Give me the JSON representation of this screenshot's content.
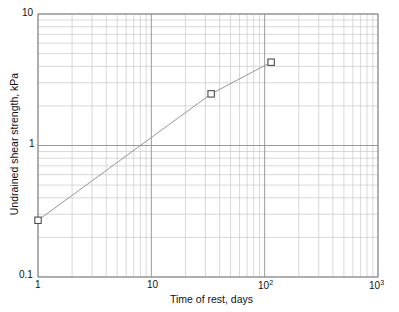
{
  "chart_data": {
    "type": "line",
    "title": "",
    "subtitle": "",
    "xlabel": "Time of rest, days",
    "ylabel": "Undrained shear strength, kPa",
    "xscale": "log",
    "yscale": "log",
    "xlim": [
      1,
      1000
    ],
    "ylim": [
      0.1,
      10
    ],
    "grid": "major-and-minor-log",
    "legend": "none",
    "marker": "open-square",
    "series": [
      {
        "name": "Undrained shear strength",
        "x": [
          1,
          33.7,
          114
        ],
        "y": [
          0.27,
          2.47,
          4.3
        ],
        "points": [
          {
            "x": 1,
            "y": 0.27
          },
          {
            "x": 33.7,
            "y": 2.47
          },
          {
            "x": 114,
            "y": 4.3
          }
        ]
      }
    ],
    "x_tick_labels": [
      "1",
      "10",
      "10²",
      "10³"
    ],
    "x_tick_values": [
      1,
      10,
      100,
      1000
    ],
    "y_tick_labels": [
      "0.1",
      "1",
      "10"
    ],
    "y_tick_values": [
      0.1,
      1,
      10
    ],
    "annotations": []
  },
  "axes": {
    "y_top_label": "10",
    "y_mid_label": "1",
    "y_bottom_label": "0.1",
    "x_first_label": "1",
    "x_second_label": "10",
    "x_third_base": "10",
    "x_third_exp": "2",
    "x_fourth_base": "10",
    "x_fourth_exp": "3",
    "x_title": "Time of rest, days",
    "y_title": "Undrained shear strength, kPa"
  },
  "style": {
    "background": "#ffffff",
    "frame_color": "#8c8c8c",
    "major_grid_color": "#888888",
    "minor_grid_color": "#bfbfbf",
    "series_line_color": "#8a8a8a",
    "marker_edge_color": "#4d4d4d",
    "marker_face_color": "#ffffff",
    "text_color": "#111111"
  }
}
